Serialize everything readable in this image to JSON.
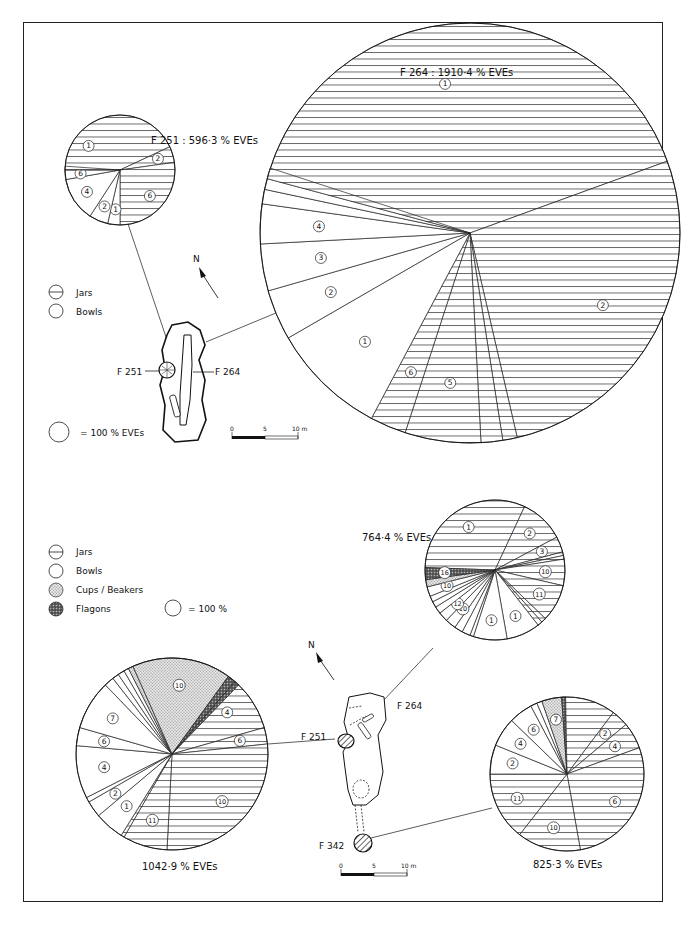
{
  "figure": {
    "caption": "",
    "colors": {
      "ink": "#1a1a1a",
      "paper": "#ffffff",
      "stipple": "#c8c8c8",
      "flagon": "#555555"
    }
  },
  "top_panel": {
    "legend": [
      {
        "pattern": "jars",
        "label": "Jars"
      },
      {
        "pattern": "bowls",
        "label": "Bowls"
      }
    ],
    "scale_note": "= 100 % EVEs",
    "north_label": "N",
    "plan_labels": {
      "left": "F 251",
      "right": "F 264"
    },
    "scalebar": {
      "ticks": [
        "0",
        "5",
        "10 m"
      ]
    }
  },
  "bottom_panel": {
    "legend": [
      {
        "pattern": "jars",
        "label": "Jars"
      },
      {
        "pattern": "bowls",
        "label": "Bowls"
      },
      {
        "pattern": "cups",
        "label": "Cups / Beakers"
      },
      {
        "pattern": "flagons",
        "label": "Flagons"
      }
    ],
    "scale_note": "= 100 %",
    "north_label": "N",
    "plan_labels": {
      "f264": "F 264",
      "f251": "F 251",
      "f342": "F 342"
    },
    "scalebar": {
      "ticks": [
        "0",
        "5",
        "10 m"
      ]
    }
  },
  "chart_data": [
    {
      "type": "pie",
      "id": "top-f251",
      "title": "F 251 : 596·3 % EVEs",
      "center": [
        120,
        170
      ],
      "radius": 55,
      "slices": [
        {
          "label": "1",
          "class": "jars",
          "start": 100,
          "end": 335
        },
        {
          "label": "2",
          "class": "jars",
          "start": 335,
          "end": 352
        },
        {
          "label": "6",
          "class": "jars",
          "start": 352,
          "end": 450
        },
        {
          "label": "1",
          "class": "bowls",
          "start": 450,
          "end": 463
        },
        {
          "label": "2",
          "class": "bowls",
          "start": 463,
          "end": 483
        },
        {
          "label": "4",
          "class": "bowls",
          "start": 483,
          "end": 530
        },
        {
          "label": "6",
          "class": "bowls",
          "start": 530,
          "end": 540
        },
        {
          "label": "7",
          "class": "jars",
          "start": 540,
          "end": 544
        }
      ]
    },
    {
      "type": "pie",
      "id": "top-f264",
      "title": "F 264 : 1910·4 % EVEs",
      "center": [
        470,
        233
      ],
      "radius": 210,
      "slices": [
        {
          "label": "1",
          "class": "jars",
          "start": 181,
          "end": 340
        },
        {
          "label": "2",
          "class": "jars",
          "start": 340,
          "end": 437
        },
        {
          "label": "3",
          "class": "jars",
          "start": 437,
          "end": 441
        },
        {
          "label": "4",
          "class": "jars",
          "start": 441,
          "end": 447
        },
        {
          "label": "5",
          "class": "jars",
          "start": 447,
          "end": 468
        },
        {
          "label": "6",
          "class": "jars",
          "start": 468,
          "end": 478
        },
        {
          "label": "1",
          "class": "bowls",
          "start": 478,
          "end": 510
        },
        {
          "label": "2",
          "class": "bowls",
          "start": 510,
          "end": 524
        },
        {
          "label": "3",
          "class": "bowls",
          "start": 524,
          "end": 537
        },
        {
          "label": "4",
          "class": "bowls",
          "start": 537,
          "end": 548
        },
        {
          "label": "5",
          "class": "bowls",
          "start": 548,
          "end": 552
        },
        {
          "label": "6",
          "class": "bowls",
          "start": 552,
          "end": 555
        },
        {
          "label": "7",
          "class": "jars",
          "start": 555,
          "end": 541
        }
      ]
    },
    {
      "type": "pie",
      "id": "bottom-f264",
      "title": "764·4 % EVEs",
      "center": [
        495,
        570
      ],
      "radius": 70,
      "slices": [
        {
          "label": "1",
          "class": "jars",
          "start": 182,
          "end": 295
        },
        {
          "label": "2",
          "class": "jars",
          "start": 295,
          "end": 332
        },
        {
          "label": "3",
          "class": "jars",
          "start": 332,
          "end": 345
        },
        {
          "label": "4",
          "class": "jars",
          "start": 345,
          "end": 348
        },
        {
          "label": "6",
          "class": "jars",
          "start": 348,
          "end": 351
        },
        {
          "label": "10",
          "class": "jars",
          "start": 351,
          "end": 373
        },
        {
          "label": "11",
          "class": "jars",
          "start": 373,
          "end": 404
        },
        {
          "label": "12",
          "class": "jars",
          "start": 404,
          "end": 408
        },
        {
          "label": "16",
          "class": "jars",
          "start": 408,
          "end": 412
        },
        {
          "label": "1",
          "class": "bowls",
          "start": 412,
          "end": 440
        },
        {
          "label": "1",
          "class": "bowls",
          "start": 440,
          "end": 468
        },
        {
          "label": "3",
          "class": "bowls",
          "start": 468,
          "end": 471
        },
        {
          "label": "4",
          "class": "bowls",
          "start": 471,
          "end": 478
        },
        {
          "label": "7",
          "class": "bowls",
          "start": 478,
          "end": 485
        },
        {
          "label": "10",
          "class": "bowls",
          "start": 485,
          "end": 494
        },
        {
          "label": "12",
          "class": "bowls",
          "start": 494,
          "end": 502
        },
        {
          "label": "14",
          "class": "bowls",
          "start": 502,
          "end": 508
        },
        {
          "label": "4",
          "class": "bowls",
          "start": 508,
          "end": 513
        },
        {
          "label": "7",
          "class": "bowls",
          "start": 513,
          "end": 518
        },
        {
          "label": "10",
          "class": "bowls",
          "start": 518,
          "end": 526
        },
        {
          "label": "12",
          "class": "cups",
          "start": 526,
          "end": 532
        },
        {
          "label": "16",
          "class": "flagons",
          "start": 532,
          "end": 542
        }
      ]
    },
    {
      "type": "pie",
      "id": "bottom-f251",
      "title": "1042·9 % EVEs",
      "center": [
        172,
        754
      ],
      "radius": 96,
      "slices": [
        {
          "label": "1",
          "class": "jars",
          "start": 184,
          "end": 300
        },
        {
          "label": "2",
          "class": "jars",
          "start": 300,
          "end": 302
        },
        {
          "label": "4",
          "class": "jars",
          "start": 302,
          "end": 344
        },
        {
          "label": "6",
          "class": "jars",
          "start": 344,
          "end": 354
        },
        {
          "label": "10",
          "class": "jars",
          "start": 354,
          "end": 453
        },
        {
          "label": "11",
          "class": "jars",
          "start": 453,
          "end": 480
        },
        {
          "label": "12",
          "class": "jars",
          "start": 480,
          "end": 482
        },
        {
          "label": "1",
          "class": "bowls",
          "start": 482,
          "end": 500
        },
        {
          "label": "2",
          "class": "bowls",
          "start": 500,
          "end": 510
        },
        {
          "label": "3",
          "class": "bowls",
          "start": 510,
          "end": 513
        },
        {
          "label": "4",
          "class": "bowls",
          "start": 513,
          "end": 545
        },
        {
          "label": "6",
          "class": "bowls",
          "start": 545,
          "end": 556
        },
        {
          "label": "7",
          "class": "bowls",
          "start": 556,
          "end": 586
        },
        {
          "label": "10",
          "class": "bowls",
          "start": 586,
          "end": 592
        },
        {
          "label": "11",
          "class": "bowls",
          "start": 592,
          "end": 596
        },
        {
          "label": "13",
          "class": "bowls",
          "start": 596,
          "end": 600
        },
        {
          "label": "25",
          "class": "bowls",
          "start": 600,
          "end": 603
        },
        {
          "label": "4",
          "class": "cups",
          "start": 603,
          "end": 606
        },
        {
          "label": "10",
          "class": "cups",
          "start": 606,
          "end": 666
        },
        {
          "label": "13",
          "class": "flagons",
          "start": 666,
          "end": 671
        },
        {
          "label": "15",
          "class": "flagons",
          "start": 671,
          "end": 544
        }
      ]
    },
    {
      "type": "pie",
      "id": "bottom-f342",
      "title": "825·3 % EVEs",
      "center": [
        567,
        774
      ],
      "radius": 77,
      "slices": [
        {
          "label": "1",
          "class": "jars",
          "start": 182,
          "end": 307
        },
        {
          "label": "2",
          "class": "jars",
          "start": 307,
          "end": 320
        },
        {
          "label": "4",
          "class": "jars",
          "start": 320,
          "end": 340
        },
        {
          "label": "6",
          "class": "jars",
          "start": 340,
          "end": 440
        },
        {
          "label": "10",
          "class": "jars",
          "start": 440,
          "end": 488
        },
        {
          "label": "11",
          "class": "jars",
          "start": 488,
          "end": 540
        },
        {
          "label": "2",
          "class": "bowls",
          "start": 540,
          "end": 562
        },
        {
          "label": "4",
          "class": "bowls",
          "start": 562,
          "end": 584
        },
        {
          "label": "6",
          "class": "bowls",
          "start": 584,
          "end": 602
        },
        {
          "label": "7",
          "class": "bowls",
          "start": 602,
          "end": 607
        },
        {
          "label": "10",
          "class": "bowls",
          "start": 607,
          "end": 611
        },
        {
          "label": "7",
          "class": "cups",
          "start": 611,
          "end": 626
        },
        {
          "label": "13",
          "class": "flagons",
          "start": 626,
          "end": 542
        }
      ]
    }
  ]
}
